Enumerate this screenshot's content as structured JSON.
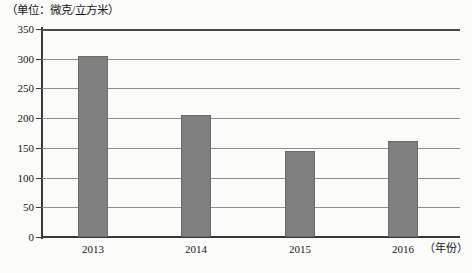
{
  "chart_data": {
    "type": "bar",
    "title": "",
    "subtitle": "",
    "unit_label": "（单位：微克/立方米）",
    "xlabel": "（年份）",
    "ylabel": "",
    "categories": [
      "2013",
      "2014",
      "2015",
      "2016"
    ],
    "values": [
      305,
      205,
      145,
      162
    ],
    "series": [
      {
        "name": "",
        "values": [
          305,
          205,
          145,
          162
        ]
      }
    ],
    "ylim": [
      0,
      350
    ],
    "y_ticks": [
      0,
      50,
      100,
      150,
      200,
      250,
      300,
      350
    ],
    "y_tick_labels": [
      "0",
      "50",
      "100",
      "150",
      "200",
      "250",
      "300",
      "350"
    ],
    "grid": true,
    "legend": "none",
    "bar_color": "#808080",
    "bar_border_color": "#6b6b6b",
    "axis_color": "#3a3a3a",
    "gridline_color": "#8e8e8e",
    "background_color": "#fbfbfa"
  }
}
